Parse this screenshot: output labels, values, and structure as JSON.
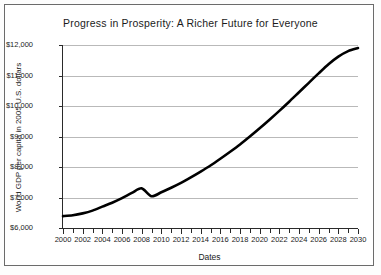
{
  "chart_data": {
    "type": "line",
    "title": "Progress in Prosperity: A Richer Future for Everyone",
    "xlabel": "Dates",
    "ylabel": "World GDP per capita in 2005 U.S. dollars",
    "xlim": [
      2000,
      2030
    ],
    "ylim": [
      6000,
      12000
    ],
    "grid": true,
    "legend": "none",
    "y_tick_labels": [
      "$12,000",
      "$11,000",
      "$10,000",
      "$9,000",
      "$8,000",
      "$7,000",
      "$6,000"
    ],
    "y_tick_values": [
      12000,
      11000,
      10000,
      9000,
      8000,
      7000,
      6000
    ],
    "x_tick_labels": [
      "2000",
      "2002",
      "2004",
      "2006",
      "2008",
      "2010",
      "2012",
      "2014",
      "2016",
      "2018",
      "2020",
      "2022",
      "2024",
      "2026",
      "2028",
      "2030"
    ],
    "x_tick_values": [
      2000,
      2002,
      2004,
      2006,
      2008,
      2010,
      2012,
      2014,
      2016,
      2018,
      2020,
      2022,
      2024,
      2026,
      2028,
      2030
    ],
    "x_minor_tick_values": [
      2000,
      2001,
      2002,
      2003,
      2004,
      2005,
      2006,
      2007,
      2008,
      2009,
      2010,
      2011,
      2012,
      2013,
      2014,
      2015,
      2016,
      2017,
      2018,
      2019,
      2020,
      2021,
      2022,
      2023,
      2024,
      2025,
      2026,
      2027,
      2028,
      2029,
      2030
    ],
    "series": [
      {
        "name": "World GDP per capita",
        "color": "#000000",
        "x": [
          2000,
          2001,
          2002,
          2003,
          2004,
          2005,
          2006,
          2007,
          2008,
          2009,
          2010,
          2011,
          2012,
          2013,
          2014,
          2015,
          2016,
          2017,
          2018,
          2019,
          2020,
          2021,
          2022,
          2023,
          2024,
          2025,
          2026,
          2027,
          2028,
          2029,
          2030
        ],
        "values": [
          6390,
          6420,
          6480,
          6570,
          6700,
          6830,
          6980,
          7150,
          7300,
          7040,
          7170,
          7320,
          7480,
          7660,
          7850,
          8050,
          8270,
          8500,
          8740,
          9000,
          9270,
          9550,
          9840,
          10140,
          10450,
          10760,
          11070,
          11370,
          11620,
          11800,
          11900
        ]
      }
    ]
  }
}
